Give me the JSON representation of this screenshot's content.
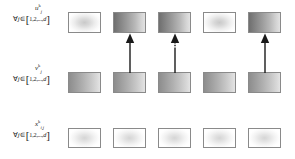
{
  "diagram": {
    "rows": [
      {
        "id": "row-u",
        "variable": "u",
        "superscript": "k",
        "subscript": "j",
        "quantifier_forall": "∀",
        "quantifier_index": "j",
        "quantifier_in": "∈",
        "bracket_open": "[",
        "set_text": "1,2,...,",
        "set_last": "d",
        "bracket_close": "]",
        "boxes": [
          {
            "name": "u-box-1",
            "fill": "radial-light"
          },
          {
            "name": "u-box-2",
            "fill": "linear-dark"
          },
          {
            "name": "u-box-3",
            "fill": "linear-dark"
          },
          {
            "name": "u-box-4",
            "fill": "radial-light"
          },
          {
            "name": "u-box-5",
            "fill": "linear-dark"
          }
        ]
      },
      {
        "id": "row-v",
        "variable": "v",
        "superscript": "k",
        "subscript": "j",
        "quantifier_forall": "∀",
        "quantifier_index": "j",
        "quantifier_in": "∈",
        "bracket_open": "[",
        "set_text": "1,2,...,",
        "set_last": "d",
        "bracket_close": "]",
        "boxes": [
          {
            "name": "v-box-1",
            "fill": "linear-mid"
          },
          {
            "name": "v-box-2",
            "fill": "linear-mid"
          },
          {
            "name": "v-box-3",
            "fill": "linear-mid"
          },
          {
            "name": "v-box-4",
            "fill": "linear-mid"
          },
          {
            "name": "v-box-5",
            "fill": "linear-mid"
          }
        ]
      },
      {
        "id": "row-x",
        "variable": "x",
        "superscript": "k",
        "subscript": "i,j",
        "quantifier_forall": "∀",
        "quantifier_index": "j",
        "quantifier_in": "∈",
        "bracket_open": "[",
        "set_text": "1,2,...,",
        "set_last": "d",
        "bracket_close": "]",
        "boxes": [
          {
            "name": "x-box-1",
            "fill": "radial-faint"
          },
          {
            "name": "x-box-2",
            "fill": "radial-faint"
          },
          {
            "name": "x-box-3",
            "fill": "radial-faint"
          },
          {
            "name": "x-box-4",
            "fill": "radial-faint"
          },
          {
            "name": "x-box-5",
            "fill": "radial-faint"
          }
        ]
      }
    ],
    "arrows": [
      {
        "name": "arrow-column-2",
        "column": 2,
        "style": "solid",
        "direction": "up"
      },
      {
        "name": "arrow-column-3",
        "column": 3,
        "style": "dashed",
        "direction": "up"
      },
      {
        "name": "arrow-column-5",
        "column": 5,
        "style": "solid",
        "direction": "up"
      }
    ],
    "colors": {
      "border": "#8a8a8a",
      "arrow": "#1a1a1a",
      "text": "#1a1a1a",
      "background": "#ffffff"
    }
  }
}
